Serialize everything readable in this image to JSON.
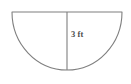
{
  "figure": {
    "shape_name": "semicircle",
    "background_color": "#ffffff",
    "stroke_color": "#7f7f7f",
    "fill_color": "#ffffff",
    "label_color": "#4d4d4d",
    "labels": {
      "radius": "3 ft"
    },
    "measurements": {
      "radius_value": "3",
      "radius_unit": "ft"
    },
    "geometry": {
      "diameter_y": 12,
      "left_x": 12,
      "right_x": 122,
      "center_x": 67,
      "arc_bottom_y": 70,
      "radius_px": 55
    }
  }
}
